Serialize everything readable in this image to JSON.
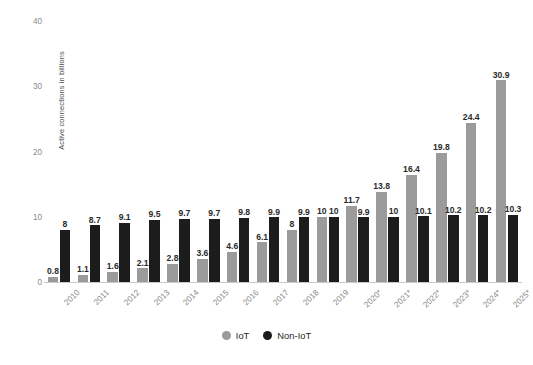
{
  "chart_data": {
    "type": "bar",
    "title": "",
    "subtitle": "",
    "xlabel": "",
    "ylabel": "Active connections in billions",
    "ylim": [
      0,
      42
    ],
    "yticks": [
      0,
      10,
      20,
      30,
      40
    ],
    "ytick_labels": [
      "0",
      "10",
      "20",
      "30",
      "40"
    ],
    "grid": false,
    "legend_position": "bottom-center",
    "categories": [
      "2010",
      "2011",
      "2012",
      "2013",
      "2014",
      "2015",
      "2016",
      "2017",
      "2018",
      "2019",
      "2020*",
      "2021*",
      "2022*",
      "2023*",
      "2024*",
      "2025*"
    ],
    "series": [
      {
        "name": "IoT",
        "color": "#9b9b9b",
        "values": [
          0.8,
          1.1,
          1.6,
          2.1,
          2.8,
          3.6,
          4.6,
          6.1,
          8,
          10,
          11.7,
          13.8,
          16.4,
          19.8,
          24.4,
          30.9
        ],
        "labels": [
          "0.8",
          "1.1",
          "1.6",
          "2.1",
          "2.8",
          "3.6",
          "4.6",
          "6.1",
          "8",
          "10",
          "11.7",
          "13.8",
          "16.4",
          "19.8",
          "24.4",
          "30.9"
        ]
      },
      {
        "name": "Non-IoT",
        "color": "#1c1c1c",
        "values": [
          8,
          8.7,
          9.1,
          9.5,
          9.7,
          9.7,
          9.8,
          9.9,
          9.9,
          10,
          9.9,
          10,
          10.1,
          10.2,
          10.2,
          10.3
        ],
        "labels": [
          "8",
          "8.7",
          "9.1",
          "9.5",
          "9.7",
          "9.7",
          "9.8",
          "9.9",
          "9.9",
          "10",
          "9.9",
          "10",
          "10.1",
          "10.2",
          "10.2",
          "10.3"
        ]
      }
    ]
  },
  "legend": {
    "entries": [
      {
        "label": "IoT",
        "color": "#9b9b9b"
      },
      {
        "label": "Non-IoT",
        "color": "#1c1c1c"
      }
    ]
  },
  "caption": {
    "text": ""
  }
}
